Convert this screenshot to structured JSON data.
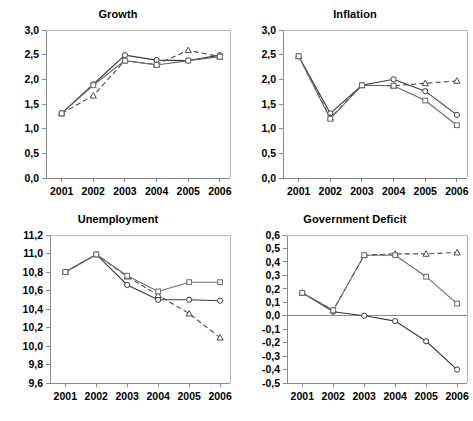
{
  "figure": {
    "width": 473,
    "height": 421,
    "background": "#ffffff",
    "layout": "2x2 grid of line charts"
  },
  "chart_data": [
    {
      "type": "line",
      "title": "Growth",
      "panel": "top-left",
      "xlabel": "",
      "ylabel": "",
      "x": [
        "2001",
        "2002",
        "2003",
        "2004",
        "2005",
        "2006"
      ],
      "categories": [
        "2001",
        "2002",
        "2003",
        "2004",
        "2005",
        "2006"
      ],
      "ylim": [
        0.0,
        3.0
      ],
      "ytick_labels": [
        "0,0",
        "0,5",
        "1,0",
        "1,5",
        "2,0",
        "2,5",
        "3,0"
      ],
      "ytick_values": [
        0.0,
        0.5,
        1.0,
        1.5,
        2.0,
        2.5,
        3.0
      ],
      "xtick_labels": [
        "2001",
        "2002",
        "2003",
        "2004",
        "2005",
        "2006"
      ],
      "grid": false,
      "legend": "none",
      "series": [
        {
          "name": "series-circle-solid",
          "marker": "circle",
          "linestyle": "solid",
          "color": "#3a3a3a",
          "values": [
            1.31,
            1.9,
            2.49,
            2.39,
            2.38,
            2.49
          ]
        },
        {
          "name": "series-triangle-dashed",
          "marker": "triangle",
          "linestyle": "dashed",
          "color": "#4a4a4a",
          "values": [
            1.31,
            1.67,
            2.38,
            2.3,
            2.59,
            2.46
          ]
        },
        {
          "name": "series-square-dotted",
          "marker": "square",
          "linestyle": "solid-light",
          "color": "#6b6b6b",
          "values": [
            1.31,
            1.88,
            2.38,
            2.29,
            2.38,
            2.46
          ]
        }
      ]
    },
    {
      "type": "line",
      "title": "Inflation",
      "panel": "top-right",
      "xlabel": "",
      "ylabel": "",
      "x": [
        "2001",
        "2002",
        "2003",
        "2004",
        "2005",
        "2006"
      ],
      "categories": [
        "2001",
        "2002",
        "2003",
        "2004",
        "2005",
        "2006"
      ],
      "ylim": [
        0.0,
        3.0
      ],
      "ytick_labels": [
        "0,0",
        "0,5",
        "1,0",
        "1,5",
        "2,0",
        "2,5",
        "3,0"
      ],
      "ytick_values": [
        0.0,
        0.5,
        1.0,
        1.5,
        2.0,
        2.5,
        3.0
      ],
      "xtick_labels": [
        "2001",
        "2002",
        "2003",
        "2004",
        "2005",
        "2006"
      ],
      "grid": false,
      "legend": "none",
      "series": [
        {
          "name": "series-circle-solid",
          "marker": "circle",
          "linestyle": "solid",
          "color": "#3a3a3a",
          "values": [
            2.47,
            1.31,
            1.88,
            2.0,
            1.76,
            1.28
          ]
        },
        {
          "name": "series-triangle-dashed",
          "marker": "triangle",
          "linestyle": "dashed",
          "color": "#4a4a4a",
          "values": [
            2.47,
            1.22,
            1.88,
            1.87,
            1.92,
            1.97
          ]
        },
        {
          "name": "series-square-dotted",
          "marker": "square",
          "linestyle": "solid-light",
          "color": "#6b6b6b",
          "values": [
            2.47,
            1.2,
            1.88,
            1.87,
            1.57,
            1.07
          ]
        }
      ]
    },
    {
      "type": "line",
      "title": "Unemployment",
      "panel": "bottom-left",
      "xlabel": "",
      "ylabel": "",
      "x": [
        "2001",
        "2002",
        "2003",
        "2004",
        "2005",
        "2006"
      ],
      "categories": [
        "2001",
        "2002",
        "2003",
        "2004",
        "2005",
        "2006"
      ],
      "ylim": [
        9.6,
        11.2
      ],
      "ytick_labels": [
        "9,6",
        "9,8",
        "10,0",
        "10,2",
        "10,4",
        "10,6",
        "10,8",
        "11,0",
        "11,2"
      ],
      "ytick_values": [
        9.6,
        9.8,
        10.0,
        10.2,
        10.4,
        10.6,
        10.8,
        11.0,
        11.2
      ],
      "xtick_labels": [
        "2001",
        "2002",
        "2003",
        "2004",
        "2005",
        "2006"
      ],
      "grid": false,
      "legend": "none",
      "series": [
        {
          "name": "series-circle-solid",
          "marker": "circle",
          "linestyle": "solid",
          "color": "#3a3a3a",
          "values": [
            10.8,
            10.99,
            10.66,
            10.5,
            10.5,
            10.49
          ]
        },
        {
          "name": "series-triangle-dashed",
          "marker": "triangle",
          "linestyle": "dashed",
          "color": "#4a4a4a",
          "values": [
            10.8,
            10.99,
            10.75,
            10.55,
            10.35,
            10.09
          ]
        },
        {
          "name": "series-square-dotted",
          "marker": "square",
          "linestyle": "solid-light",
          "color": "#6b6b6b",
          "values": [
            10.8,
            10.99,
            10.76,
            10.59,
            10.69,
            10.69
          ]
        }
      ]
    },
    {
      "type": "line",
      "title": "Government Deficit",
      "panel": "bottom-right",
      "xlabel": "",
      "ylabel": "",
      "x": [
        "2001",
        "2002",
        "2003",
        "2004",
        "2005",
        "2006"
      ],
      "categories": [
        "2001",
        "2002",
        "2003",
        "2004",
        "2005",
        "2006"
      ],
      "ylim": [
        -0.5,
        0.6
      ],
      "ytick_labels": [
        "-0,5",
        "-0,4",
        "-0,3",
        "-0,2",
        "-0,1",
        "0,0",
        "0,1",
        "0,2",
        "0,3",
        "0,4",
        "0,5",
        "0,6"
      ],
      "ytick_values": [
        -0.5,
        -0.4,
        -0.3,
        -0.2,
        -0.1,
        0.0,
        0.1,
        0.2,
        0.3,
        0.4,
        0.5,
        0.6
      ],
      "xtick_labels": [
        "2001",
        "2002",
        "2003",
        "2004",
        "2005",
        "2006"
      ],
      "grid": false,
      "legend": "none",
      "zero_line": true,
      "series": [
        {
          "name": "series-circle-solid",
          "marker": "circle",
          "linestyle": "solid",
          "color": "#3a3a3a",
          "values": [
            0.17,
            0.03,
            0.0,
            -0.04,
            -0.19,
            -0.4
          ]
        },
        {
          "name": "series-triangle-dashed",
          "marker": "triangle",
          "linestyle": "dashed",
          "color": "#4a4a4a",
          "values": [
            0.17,
            0.04,
            0.45,
            0.46,
            0.46,
            0.47
          ]
        },
        {
          "name": "series-square-dotted",
          "marker": "square",
          "linestyle": "solid-light",
          "color": "#6b6b6b",
          "values": [
            0.17,
            0.04,
            0.45,
            0.45,
            0.29,
            0.09
          ]
        }
      ]
    }
  ]
}
